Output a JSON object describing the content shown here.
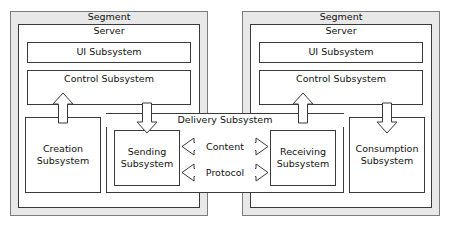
{
  "diagram": {
    "colors": {
      "segment_fill": "#e8e8e8",
      "box_fill": "#ffffff",
      "stroke": "#3a3a3a",
      "segment_stroke": "#7d7d7d",
      "text": "#111111"
    },
    "segments": [
      {
        "id": "left",
        "label": "Segment",
        "server_label": "Server",
        "ui_label": "UI Subsystem",
        "control_label": "Control Subsystem",
        "leaf_label_line1": "Creation",
        "leaf_label_line2": "Subsystem",
        "inner_label_line1": "Sending",
        "inner_label_line2": "Subsystem"
      },
      {
        "id": "right",
        "label": "Segment",
        "server_label": "Server",
        "ui_label": "UI Subsystem",
        "control_label": "Control Subsystem",
        "leaf_label_line1": "Consumption",
        "leaf_label_line2": "Subsystem",
        "inner_label_line1": "Receiving",
        "inner_label_line2": "Subsystem"
      }
    ],
    "delivery": {
      "label": "Delivery Subsystem",
      "channels": [
        {
          "label": "Content"
        },
        {
          "label": "Protocol"
        }
      ]
    },
    "arrows": [
      {
        "name": "creation-to-control",
        "direction": "up"
      },
      {
        "name": "control-to-sending",
        "direction": "down"
      },
      {
        "name": "receiving-to-control",
        "direction": "up"
      },
      {
        "name": "control-to-consumption",
        "direction": "down"
      },
      {
        "name": "content-channel",
        "direction": "bidirectional"
      },
      {
        "name": "protocol-channel",
        "direction": "bidirectional"
      }
    ]
  }
}
